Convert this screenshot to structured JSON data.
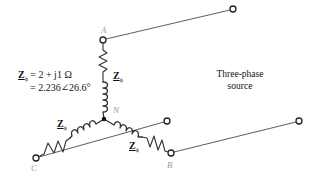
{
  "diagram": {
    "nodes": {
      "a": {
        "label": "A"
      },
      "b": {
        "label": "B"
      },
      "c": {
        "label": "C"
      },
      "n": {
        "label": "N"
      }
    },
    "impedance": {
      "symbol": "Z",
      "subscript": "ϕ",
      "line1": "= 2 + j1 Ω",
      "line2": "= 2.236∠26.6°"
    },
    "branch_labels": {
      "a": "Z",
      "b": "Z",
      "c": "Z",
      "subscript": "ϕ"
    },
    "source": {
      "line1": "Three-phase",
      "line2": "source"
    },
    "colors": {
      "line": "#333333",
      "node_label": "#9a9a9a",
      "text": "#111111"
    }
  }
}
